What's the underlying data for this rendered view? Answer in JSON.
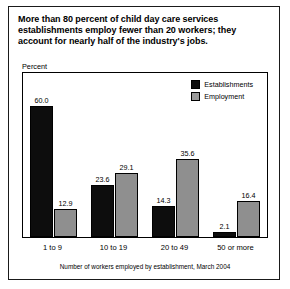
{
  "figure": {
    "title": "More than 80 percent of child day care services establishments employ fewer than 20 workers; they account for nearly half of the industry's jobs.",
    "axis_caption": "Percent",
    "footnote": "Number of workers employed by establishment, March 2004"
  },
  "colors": {
    "establishments": "#0d0d0d",
    "employment": "#8f8f8f",
    "frame": "#000000",
    "background": "#ffffff"
  },
  "chart_data": {
    "type": "bar",
    "title": "More than 80 percent of child day care services establishments employ fewer than 20 workers; they account for nearly half of the industry's jobs.",
    "xlabel": "Number of workers employed by establishment, March 2004",
    "ylabel": "Percent",
    "ylim": [
      0,
      65
    ],
    "grid": false,
    "legend_position": "top-right",
    "categories": [
      "1 to 9",
      "10 to 19",
      "20 to 49",
      "50 or more"
    ],
    "series": [
      {
        "name": "Establishments",
        "color": "#0d0d0d",
        "values": [
          60.0,
          23.6,
          14.3,
          2.1
        ],
        "labels": [
          "60.0",
          "23.6",
          "14.3",
          "2.1"
        ]
      },
      {
        "name": "Employment",
        "color": "#8f8f8f",
        "values": [
          12.9,
          29.1,
          35.6,
          16.4
        ],
        "labels": [
          "12.9",
          "29.1",
          "35.6",
          "16.4"
        ]
      }
    ]
  }
}
